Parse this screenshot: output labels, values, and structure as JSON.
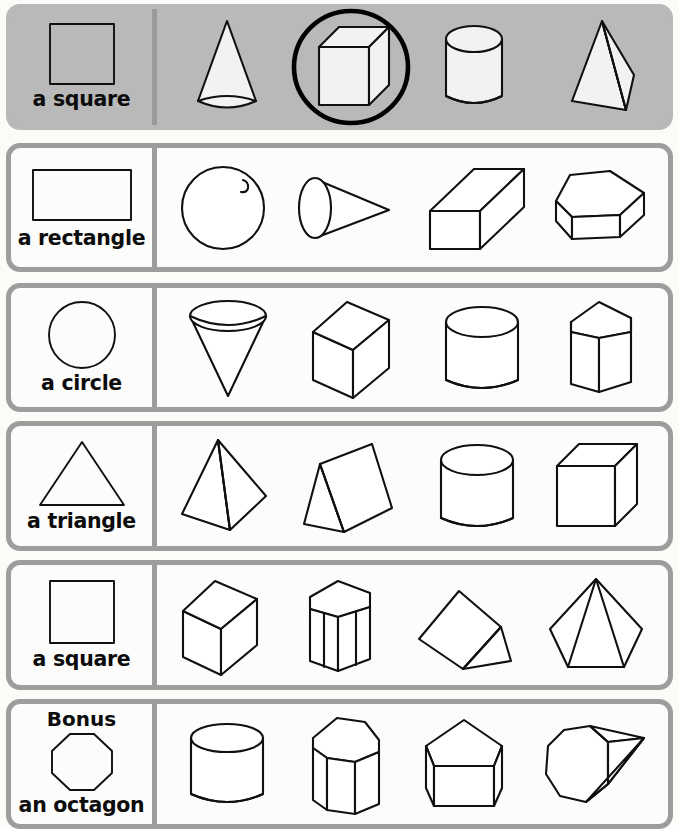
{
  "worksheet": {
    "kind": "shape-matching-worksheet",
    "row_count": 6,
    "shapes_per_row": 4,
    "example_row_background": "#b9b9b9",
    "page_background": "#fbfbf8",
    "outline_color": "#101010",
    "border_color": "#9d9d9d",
    "mark_color": "#000000"
  },
  "rows": [
    {
      "id": "row-example",
      "is_example": true,
      "bonus_label": "",
      "label": "a square",
      "label_shape": "square",
      "marked_index": 1,
      "mark_type": "circled",
      "options": [
        {
          "name": "cone",
          "label": "cone",
          "marked": false
        },
        {
          "name": "cube",
          "label": "cube",
          "marked": true
        },
        {
          "name": "cylinder",
          "label": "cylinder",
          "marked": false
        },
        {
          "name": "triangular-pyramid",
          "label": "triangular pyramid",
          "marked": false
        }
      ]
    },
    {
      "id": "row-rectangle",
      "is_example": false,
      "bonus_label": "",
      "label": "a rectangle",
      "label_shape": "rectangle",
      "marked_index": -1,
      "mark_type": "none",
      "options": [
        {
          "name": "sphere",
          "label": "sphere",
          "marked": false
        },
        {
          "name": "cone-sideways",
          "label": "cone",
          "marked": false
        },
        {
          "name": "rectangular-prism",
          "label": "rectangular prism",
          "marked": false
        },
        {
          "name": "pentagonal-prism-wide",
          "label": "pentagonal prism",
          "marked": false
        }
      ]
    },
    {
      "id": "row-circle",
      "is_example": false,
      "bonus_label": "",
      "label": "a circle",
      "label_shape": "circle",
      "marked_index": -1,
      "mark_type": "none",
      "options": [
        {
          "name": "cone-inverted",
          "label": "cone",
          "marked": false
        },
        {
          "name": "cube-tilted",
          "label": "cube",
          "marked": false
        },
        {
          "name": "cylinder",
          "label": "cylinder",
          "marked": false
        },
        {
          "name": "pentagonal-prism-tall",
          "label": "pentagonal prism",
          "marked": false
        }
      ]
    },
    {
      "id": "row-triangle",
      "is_example": false,
      "bonus_label": "",
      "label": "a triangle",
      "label_shape": "triangle",
      "marked_index": -1,
      "mark_type": "none",
      "options": [
        {
          "name": "square-pyramid",
          "label": "square pyramid",
          "marked": false
        },
        {
          "name": "triangular-prism-leaning",
          "label": "triangular prism",
          "marked": false
        },
        {
          "name": "cylinder",
          "label": "cylinder",
          "marked": false
        },
        {
          "name": "cube",
          "label": "cube",
          "marked": false
        }
      ]
    },
    {
      "id": "row-square",
      "is_example": false,
      "bonus_label": "",
      "label": "a square",
      "label_shape": "square",
      "marked_index": -1,
      "mark_type": "none",
      "options": [
        {
          "name": "cube-tilted",
          "label": "cube",
          "marked": false
        },
        {
          "name": "hexagonal-prism",
          "label": "hexagonal prism",
          "marked": false
        },
        {
          "name": "triangular-prism-tipped",
          "label": "triangular prism",
          "marked": false
        },
        {
          "name": "pentagonal-pyramid",
          "label": "pentagonal pyramid",
          "marked": false
        }
      ]
    },
    {
      "id": "row-bonus",
      "is_example": false,
      "bonus_label": "Bonus",
      "label": "an octagon",
      "label_shape": "octagon",
      "marked_index": -1,
      "mark_type": "none",
      "options": [
        {
          "name": "cylinder",
          "label": "cylinder",
          "marked": false
        },
        {
          "name": "octagonal-prism",
          "label": "octagonal prism",
          "marked": false
        },
        {
          "name": "pentagonal-prism-wide",
          "label": "pentagonal prism",
          "marked": false
        },
        {
          "name": "octagonal-pyramid-sideways",
          "label": "octagonal pyramid",
          "marked": false
        }
      ]
    }
  ]
}
